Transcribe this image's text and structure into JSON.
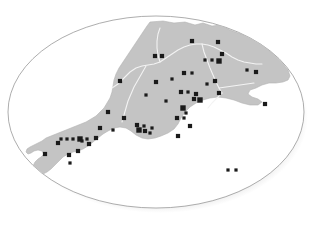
{
  "figure": {
    "region_name": "South West England",
    "width": 313,
    "height": 229,
    "background_color": "#ffffff"
  },
  "frame": {
    "shape": "ellipse",
    "center_x": 156,
    "center_y": 112,
    "radius_x": 148,
    "radius_y": 96,
    "border_color": "#8a8a8a",
    "border_width": 0.7,
    "fill_color": "#ffffff",
    "shadow_color": "#b8b8b8",
    "shadow_offset_x": 4,
    "shadow_offset_y": 5
  },
  "land": {
    "name": "South West peninsula landmass",
    "fill_color": "#c4c4c4",
    "stroke_color": "#b4b4b4",
    "outline": "M 150,22 L 163,21 L 174,23 L 185,22 L 195,25 L 203,23 L 212,26 L 221,25 L 230,30 L 238,33 L 247,36 L 256,40 L 264,46 L 272,53 L 279,60 L 284,65 L 288,70 L 290,76 L 288,80 L 283,82 L 276,83 L 269,83 L 262,85 L 256,88 L 250,90 L 248,94 L 252,97 L 258,99 L 262,102 L 258,105 L 250,105 L 242,103 L 234,100 L 226,98 L 218,97 L 210,98 L 203,100 L 196,103 L 190,107 L 185,112 L 181,118 L 178,124 L 174,129 L 168,133 L 161,136 L 155,138 L 148,139 L 142,138 L 136,135 L 131,131 L 126,128 L 120,127 L 114,128 L 108,131 L 103,134 L 98,138 L 93,142 L 88,146 L 83,149 L 78,151 L 73,152 L 68,154 L 63,157 L 59,161 L 55,165 L 51,169 L 47,172 L 43,174 L 39,175 L 36,173 L 34,170 L 33,166 L 35,162 L 38,159 L 41,157 L 44,154 L 42,151 L 38,150 L 34,151 L 31,153 L 28,154 L 26,152 L 27,149 L 30,147 L 34,145 L 38,143 L 42,141 L 46,138 L 51,136 L 56,134 L 61,132 L 66,130 L 71,128 L 76,126 L 81,124 L 86,122 L 91,119 L 96,116 L 100,112 L 104,108 L 107,103 L 110,98 L 112,92 L 113,86 L 114,80 L 116,74 L 119,68 L 123,62 L 127,56 L 131,50 L 135,44 L 139,38 L 143,32 L 147,26 Z",
    "coast_notes": "Cornwall tapers south-west to Land's End with the Lizard lobe; Devon and Somerset form the broad body; Dorset coast runs east toward Portland and Purbeck."
  },
  "boundaries": {
    "name": "county and administrative boundary lines",
    "stroke_color": "#f3f3f3",
    "stroke_width": 1.1,
    "paths": [
      "M 112,88 L 118,84 L 124,78 L 130,72 L 136,68 L 142,66 L 148,65 L 154,64 L 160,62 L 166,58 L 172,54 L 178,50 L 184,47 L 190,45 L 196,44 L 202,44 L 208,45 L 214,47 L 220,50 L 226,53 L 232,57 L 238,60 L 244,62 L 250,63 L 256,64 L 262,64",
      "M 202,44 L 204,52 L 207,60 L 210,68 L 213,75 L 216,82 L 219,88 L 222,93",
      "M 219,88 L 226,87 L 233,86 L 240,85 L 247,84 L 254,83",
      "M 146,66 L 142,73 L 138,80 L 134,87 L 131,94 L 128,101 L 126,108 L 124,115 L 122,122",
      "M 222,93 L 217,98 L 212,103 L 208,108",
      "M 160,62 L 158,55 L 157,48 L 157,41 L 158,34 L 160,28"
    ]
  },
  "markers": {
    "name": "survey site markers",
    "shape": "square",
    "fill_color": "#1a1a1a",
    "size_small": 3.2,
    "size_medium": 4.2,
    "size_large": 5.4,
    "count": 57,
    "points": [
      {
        "x": 192,
        "y": 41,
        "size": "medium",
        "label": "site-01"
      },
      {
        "x": 218,
        "y": 42,
        "size": "medium",
        "label": "site-02"
      },
      {
        "x": 222,
        "y": 54,
        "size": "medium",
        "label": "site-03"
      },
      {
        "x": 155,
        "y": 56,
        "size": "medium",
        "label": "site-04"
      },
      {
        "x": 162,
        "y": 56,
        "size": "medium",
        "label": "site-05"
      },
      {
        "x": 205,
        "y": 60,
        "size": "small",
        "label": "site-06"
      },
      {
        "x": 212,
        "y": 60,
        "size": "small",
        "label": "site-07"
      },
      {
        "x": 219,
        "y": 61,
        "size": "large",
        "label": "site-08"
      },
      {
        "x": 184,
        "y": 73,
        "size": "medium",
        "label": "site-09"
      },
      {
        "x": 192,
        "y": 73,
        "size": "small",
        "label": "site-10"
      },
      {
        "x": 247,
        "y": 70,
        "size": "small",
        "label": "site-11"
      },
      {
        "x": 256,
        "y": 72,
        "size": "medium",
        "label": "site-12"
      },
      {
        "x": 120,
        "y": 81,
        "size": "medium",
        "label": "site-13"
      },
      {
        "x": 156,
        "y": 82,
        "size": "medium",
        "label": "site-14"
      },
      {
        "x": 215,
        "y": 81,
        "size": "medium",
        "label": "site-15"
      },
      {
        "x": 181,
        "y": 92,
        "size": "medium",
        "label": "site-16"
      },
      {
        "x": 188,
        "y": 92,
        "size": "small",
        "label": "site-17"
      },
      {
        "x": 196,
        "y": 94,
        "size": "medium",
        "label": "site-18"
      },
      {
        "x": 219,
        "y": 93,
        "size": "medium",
        "label": "site-19"
      },
      {
        "x": 194,
        "y": 99,
        "size": "medium",
        "label": "site-20"
      },
      {
        "x": 200,
        "y": 100,
        "size": "large",
        "label": "site-21"
      },
      {
        "x": 265,
        "y": 104,
        "size": "medium",
        "label": "site-22"
      },
      {
        "x": 183,
        "y": 108,
        "size": "large",
        "label": "site-23"
      },
      {
        "x": 186,
        "y": 113,
        "size": "small",
        "label": "site-24"
      },
      {
        "x": 108,
        "y": 112,
        "size": "medium",
        "label": "site-25"
      },
      {
        "x": 124,
        "y": 118,
        "size": "medium",
        "label": "site-26"
      },
      {
        "x": 177,
        "y": 118,
        "size": "medium",
        "label": "site-27"
      },
      {
        "x": 184,
        "y": 118,
        "size": "small",
        "label": "site-28"
      },
      {
        "x": 190,
        "y": 126,
        "size": "medium",
        "label": "site-29"
      },
      {
        "x": 100,
        "y": 128,
        "size": "medium",
        "label": "site-30"
      },
      {
        "x": 137,
        "y": 125,
        "size": "medium",
        "label": "site-31"
      },
      {
        "x": 144,
        "y": 126,
        "size": "small",
        "label": "site-32"
      },
      {
        "x": 139,
        "y": 130,
        "size": "large",
        "label": "site-33"
      },
      {
        "x": 145,
        "y": 131,
        "size": "medium",
        "label": "site-34"
      },
      {
        "x": 152,
        "y": 128,
        "size": "small",
        "label": "site-35"
      },
      {
        "x": 150,
        "y": 133,
        "size": "small",
        "label": "site-36"
      },
      {
        "x": 178,
        "y": 136,
        "size": "medium",
        "label": "site-37"
      },
      {
        "x": 61,
        "y": 139,
        "size": "small",
        "label": "site-38"
      },
      {
        "x": 67,
        "y": 139,
        "size": "small",
        "label": "site-39"
      },
      {
        "x": 73,
        "y": 139,
        "size": "small",
        "label": "site-40"
      },
      {
        "x": 80,
        "y": 139,
        "size": "large",
        "label": "site-41"
      },
      {
        "x": 87,
        "y": 139,
        "size": "small",
        "label": "site-42"
      },
      {
        "x": 96,
        "y": 138,
        "size": "medium",
        "label": "site-43"
      },
      {
        "x": 113,
        "y": 130,
        "size": "small",
        "label": "site-44"
      },
      {
        "x": 58,
        "y": 143,
        "size": "medium",
        "label": "site-45"
      },
      {
        "x": 82,
        "y": 141,
        "size": "small",
        "label": "site-46"
      },
      {
        "x": 89,
        "y": 144,
        "size": "medium",
        "label": "site-47"
      },
      {
        "x": 45,
        "y": 154,
        "size": "medium",
        "label": "site-48"
      },
      {
        "x": 69,
        "y": 155,
        "size": "medium",
        "label": "site-49"
      },
      {
        "x": 78,
        "y": 151,
        "size": "medium",
        "label": "site-50"
      },
      {
        "x": 70,
        "y": 163,
        "size": "small",
        "label": "site-51"
      },
      {
        "x": 228,
        "y": 170,
        "size": "small",
        "label": "site-52"
      },
      {
        "x": 236,
        "y": 170,
        "size": "small",
        "label": "site-53"
      },
      {
        "x": 172,
        "y": 79,
        "size": "small",
        "label": "site-54"
      },
      {
        "x": 207,
        "y": 84,
        "size": "small",
        "label": "site-55"
      },
      {
        "x": 146,
        "y": 95,
        "size": "small",
        "label": "site-56"
      },
      {
        "x": 166,
        "y": 101,
        "size": "small",
        "label": "site-57"
      }
    ]
  }
}
